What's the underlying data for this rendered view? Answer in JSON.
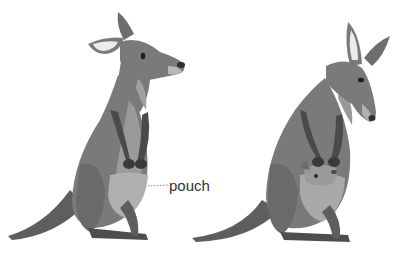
{
  "figure": {
    "subjects": [
      {
        "name": "kangaroo-without-joey"
      },
      {
        "name": "kangaroo-with-joey"
      }
    ],
    "labels": {
      "pouch": "pouch"
    }
  },
  "colors": {
    "body": "#7a7a7a",
    "dark": "#4a4a4a",
    "light": "#b8b8b8",
    "pouch": "#a9a9a9",
    "ear_inner": "#ececec",
    "leader": "#888888"
  }
}
